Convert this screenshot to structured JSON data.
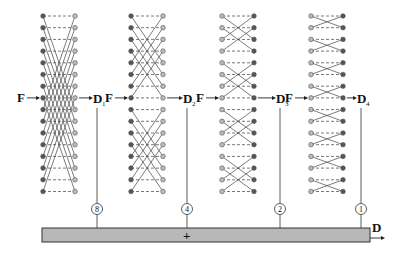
{
  "diagram": {
    "type": "butterfly-network-summation",
    "stages": [
      {
        "input_label": "F",
        "output_label": "D",
        "output_subscript": "1",
        "stride": 8,
        "weight_label": "8",
        "left_node_style": "filled",
        "right_node_style": "hollow"
      },
      {
        "input_label": "F",
        "output_label": "D",
        "output_subscript": "2",
        "stride": 4,
        "weight_label": "4",
        "left_node_style": "filled",
        "right_node_style": "hollow"
      },
      {
        "input_label": "F",
        "output_label": "D",
        "output_subscript": "3",
        "stride": 2,
        "weight_label": "2",
        "left_node_style": "hollow",
        "right_node_style": "filled"
      },
      {
        "input_label": "F",
        "output_label": "D",
        "output_subscript": "4",
        "stride": 1,
        "weight_label": "1",
        "left_node_style": "hollow",
        "right_node_style": "filled"
      }
    ],
    "rows": 16,
    "io_row": 7,
    "sum_bar": {
      "operator": "+",
      "output_label": "D"
    },
    "colors": {
      "line": "#444444",
      "dash": "#555555",
      "filled_node": "#555555",
      "hollow_node": "#bbbbbb",
      "bar_fill": "#b8b8b8",
      "bar_stroke": "#333333",
      "text": "#111111"
    }
  }
}
